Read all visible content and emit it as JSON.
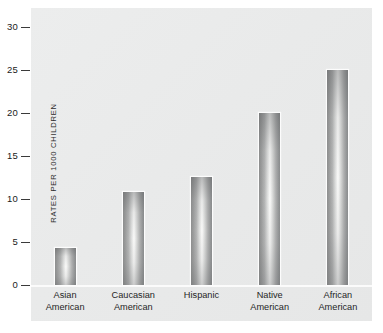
{
  "chart_data": {
    "type": "bar",
    "title": "",
    "subtitle": "",
    "xlabel": "",
    "ylabel": "RATES PER 1000 CHILDREN",
    "ylim": [
      0,
      30
    ],
    "ytick_values": [
      30,
      25,
      20,
      15,
      10,
      5,
      0
    ],
    "ytick_labels": [
      "30",
      "25",
      "20",
      "15",
      "10",
      "5",
      "0"
    ],
    "grid": false,
    "legend": false,
    "categories": [
      "Asian American",
      "Caucasian American",
      "Hispanic",
      "Native American",
      "African American"
    ],
    "category_lines": [
      [
        "Asian",
        "American"
      ],
      [
        "Caucasian",
        "American"
      ],
      [
        "Hispanic",
        ""
      ],
      [
        "Native",
        "American"
      ],
      [
        "African",
        "American"
      ]
    ],
    "values": [
      4.3,
      10.8,
      12.6,
      20.0,
      25.0
    ],
    "bar_fill": "grayscale-gradient",
    "colors": {
      "panel_background": "#eaebeb",
      "figure_background": "#ffffff",
      "bar_edge": "#8e8f8f",
      "bar_highlight": "#fbfbfa",
      "tick_mark": "#3a3a3a",
      "text": "#1a1a1a",
      "baseline": "#fbfbfb"
    }
  }
}
